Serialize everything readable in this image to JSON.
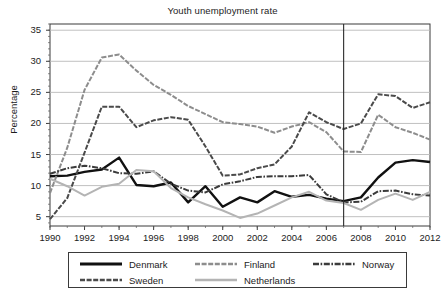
{
  "chart_data": {
    "type": "line",
    "title": "Youth unemployment rate",
    "xlabel": "",
    "ylabel": "Percentage",
    "xlim": [
      1990,
      2012
    ],
    "ylim": [
      3.5,
      36
    ],
    "grid": true,
    "legend_position": "bottom",
    "x": [
      1990,
      1991,
      1992,
      1993,
      1994,
      1995,
      1996,
      1997,
      1998,
      1999,
      2000,
      2001,
      2002,
      2003,
      2004,
      2005,
      2006,
      2007,
      2008,
      2009,
      2010,
      2011,
      2012
    ],
    "xticks": [
      "1990",
      "1992",
      "1994",
      "1996",
      "1998",
      "2000",
      "2002",
      "2004",
      "2006",
      "2008",
      "2010",
      "2012"
    ],
    "yticks": [
      "5",
      "10",
      "15",
      "20",
      "25",
      "30",
      "35"
    ],
    "annotations": [
      {
        "type": "vline",
        "x": 2007,
        "label": ""
      }
    ],
    "series": [
      {
        "name": "Denmark",
        "color": "#111111",
        "style": "solid",
        "values": [
          11.5,
          11.6,
          12.2,
          12.6,
          14.5,
          10.1,
          9.9,
          10.5,
          7.3,
          9.9,
          6.6,
          8.1,
          7.3,
          9.1,
          8.2,
          8.5,
          7.9,
          7.5,
          8.1,
          11.3,
          13.7,
          14.1,
          13.8
        ]
      },
      {
        "name": "Finland",
        "color": "#8d8d8d",
        "style": "dashed",
        "values": [
          8.8,
          16.1,
          25.4,
          30.6,
          31.1,
          28.5,
          26.2,
          24.6,
          22.8,
          21.5,
          20.2,
          19.9,
          19.5,
          18.5,
          19.5,
          20.2,
          18.6,
          15.5,
          15.4,
          21.4,
          19.4,
          18.5,
          17.4
        ]
      },
      {
        "name": "Norway",
        "color": "#3b3b3b",
        "style": "dashdot",
        "values": [
          11.9,
          12.8,
          13.2,
          12.8,
          12.0,
          11.9,
          12.3,
          10.3,
          9.2,
          8.9,
          10.2,
          10.7,
          11.4,
          11.5,
          11.5,
          11.7,
          8.6,
          7.3,
          7.4,
          9.1,
          9.2,
          8.6,
          8.4
        ]
      },
      {
        "name": "Sweden",
        "color": "#4a4a4a",
        "style": "dashed",
        "values": [
          4.6,
          8.0,
          15.3,
          22.7,
          22.7,
          19.4,
          20.5,
          21.0,
          20.6,
          16.3,
          11.6,
          11.8,
          12.8,
          13.4,
          16.3,
          21.8,
          20.2,
          19.1,
          20.0,
          24.7,
          24.4,
          22.5,
          23.4
        ]
      },
      {
        "name": "Netherlands",
        "color": "#b4b4b4",
        "style": "solid",
        "values": [
          11.1,
          9.9,
          8.4,
          9.8,
          10.3,
          12.5,
          12.3,
          9.6,
          8.1,
          7.0,
          6.0,
          4.8,
          5.5,
          6.8,
          8.1,
          9.0,
          7.6,
          7.2,
          6.1,
          7.7,
          8.7,
          7.7,
          9.0
        ]
      }
    ]
  },
  "legend": {
    "items": [
      {
        "label": "Denmark"
      },
      {
        "label": "Finland"
      },
      {
        "label": "Norway"
      },
      {
        "label": "Sweden"
      },
      {
        "label": "Netherlands"
      }
    ]
  }
}
